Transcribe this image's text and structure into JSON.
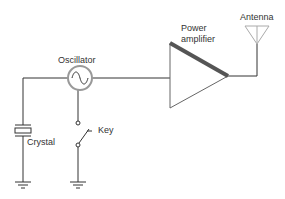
{
  "diagram": {
    "labels": {
      "oscillator": "Oscillator",
      "power_amplifier_line1": "Power",
      "power_amplifier_line2": "amplifier",
      "antenna": "Antenna",
      "key": "Key",
      "crystal": "Crystal"
    },
    "components": [
      {
        "id": "crystal",
        "label": "Crystal",
        "type": "crystal"
      },
      {
        "id": "oscillator",
        "label": "Oscillator",
        "type": "ac-source"
      },
      {
        "id": "key",
        "label": "Key",
        "type": "switch"
      },
      {
        "id": "power-amplifier",
        "label": "Power amplifier",
        "type": "amplifier"
      },
      {
        "id": "antenna",
        "label": "Antenna",
        "type": "antenna"
      }
    ],
    "connections": [
      [
        "crystal",
        "oscillator"
      ],
      [
        "oscillator",
        "power-amplifier"
      ],
      [
        "oscillator",
        "key"
      ],
      [
        "power-amplifier",
        "antenna"
      ],
      [
        "crystal",
        "ground"
      ],
      [
        "key",
        "ground"
      ]
    ],
    "colors": {
      "wire": "#333333",
      "amp_edge": "#555555",
      "antenna": "#aaaaaa",
      "osc_ring": "#999999"
    }
  }
}
